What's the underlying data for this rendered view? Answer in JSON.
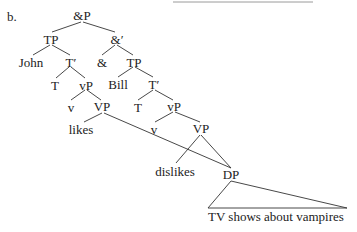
{
  "example_label": "b.",
  "nodes": {
    "andP": "&P",
    "andBar": "&′",
    "tp1": "TP",
    "john": "John",
    "tbar1": "T′",
    "t1": "T",
    "vp_small1": "vP",
    "v1": "v",
    "VP1": "VP",
    "likes": "likes",
    "and": "&",
    "tp2": "TP",
    "bill": "Bill",
    "tbar2": "T′",
    "t2": "T",
    "vp_small2": "vP",
    "v2": "v",
    "VP2": "VP",
    "dislikes": "dislikes",
    "dp": "DP",
    "dp_yield": "TV shows about vampires"
  },
  "colors": {
    "text": "#222222",
    "lines": "#333333",
    "top_rule": "#9a9a9a"
  }
}
